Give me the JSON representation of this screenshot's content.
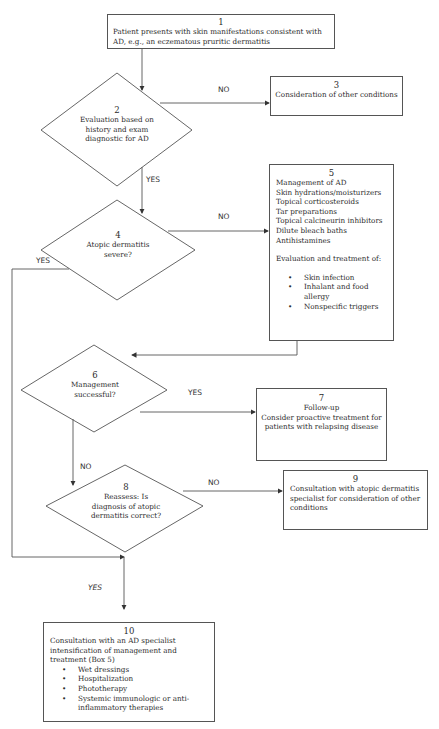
{
  "flowchart": {
    "box1": {
      "number": "1",
      "text": "Patient presents with skin manifestations consistent with AD, e.g., an eczematous pruritic dermatitis"
    },
    "diamond2": {
      "number": "2",
      "text": "Evaluation based on history and exam diagnostic for AD"
    },
    "box3": {
      "number": "3",
      "text": "Consideration of other conditions"
    },
    "diamond4": {
      "number": "4",
      "text": "Atopic dermatitis severe?"
    },
    "box5": {
      "number": "5",
      "title": "Management of AD",
      "items": [
        "Skin hydrations/moisturizers",
        "Topical corticosteroids",
        "Tar preparations",
        "Topical calcineurin inhibitors",
        "Dilute bleach baths",
        "Antihistamines"
      ],
      "subheading": "Evaluation and treatment of:",
      "bullets": [
        "Skin infection",
        "Inhalant and food allergy",
        "Nonspecific triggers"
      ]
    },
    "diamond6": {
      "number": "6",
      "text": "Management successful?"
    },
    "box7": {
      "number": "7",
      "title": "Follow-up",
      "text": "Consider proactive treatment for patients with relapsing disease"
    },
    "diamond8": {
      "number": "8",
      "text": "Reassess: Is diagnosis of atopic dermatitis correct?"
    },
    "box9": {
      "number": "9",
      "text": "Consultation with atopic dermatitis specialist for consideration of other conditions"
    },
    "box10": {
      "number": "10",
      "text": "Consultation with an AD specialist intensification of management and treatment (Box 5)",
      "bullets": [
        "Wet dressings",
        "Hospitalization",
        "Phototherapy",
        "Systemic immunologic or anti-inflammatory therapies"
      ]
    },
    "labels": {
      "d2_no": "NO",
      "d2_yes": "YES",
      "d4_no": "NO",
      "d4_yes": "YES",
      "d6_yes": "YES",
      "d6_no": "NO",
      "d8_no": "NO",
      "to10_yes": "YES"
    }
  }
}
